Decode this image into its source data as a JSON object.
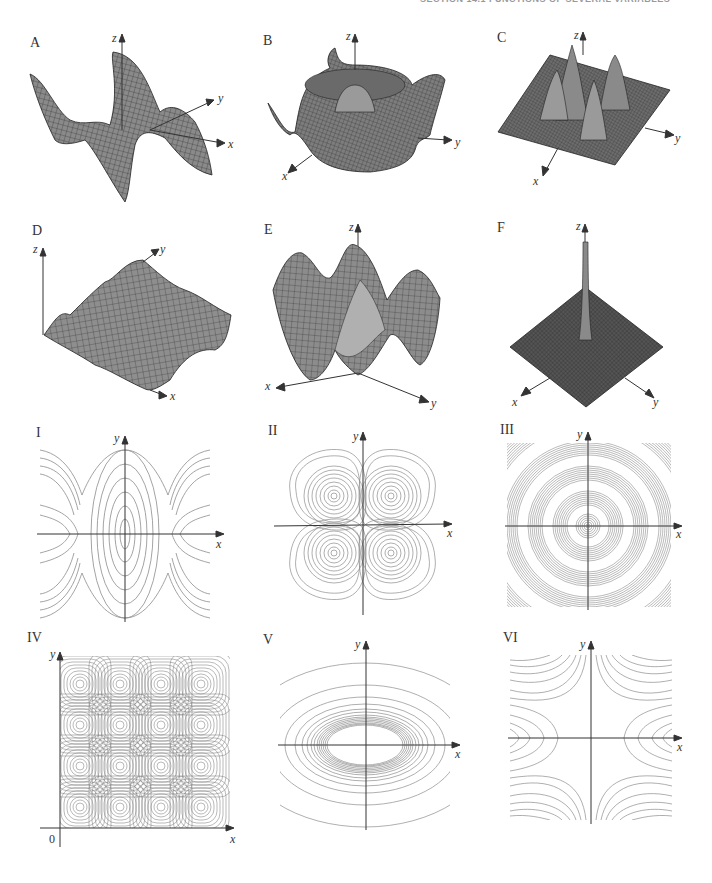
{
  "page": {
    "running_head": "SECTION 14.1  FUNCTIONS OF SEVERAL VARIABLES"
  },
  "surfaces": [
    {
      "label": "A",
      "axes": {
        "z": "z",
        "y": "y",
        "x": "x"
      },
      "description": "saddle-like twisted surface with oscillating edges"
    },
    {
      "label": "B",
      "axes": {
        "z": "z",
        "y": "y",
        "x": "x"
      },
      "description": "radially symmetric ring with central bump and raised corners"
    },
    {
      "label": "C",
      "axes": {
        "z": "z",
        "y": "y",
        "x": "x"
      },
      "description": "four gaussian peaks on a flat square"
    },
    {
      "label": "D",
      "axes": {
        "z": "z",
        "y": "y",
        "x": "x"
      },
      "description": "periodic egg-crate surface in first quadrant"
    },
    {
      "label": "E",
      "axes": {
        "z": "z",
        "y": "y",
        "x": "x"
      },
      "description": "wavy trough surface, oscillating in one direction"
    },
    {
      "label": "F",
      "axes": {
        "z": "z",
        "y": "y",
        "x": "x"
      },
      "description": "single sharp spike at origin on flat plane"
    }
  ],
  "contours": [
    {
      "label": "I",
      "axes": {
        "x": "x",
        "y": "y"
      },
      "description": "closed ellipses at origin and edges, saddle curves between"
    },
    {
      "label": "II",
      "axes": {
        "x": "x",
        "y": "y"
      },
      "description": "four-lobed closed curves, one per quadrant"
    },
    {
      "label": "III",
      "axes": {
        "x": "x",
        "y": "y"
      },
      "description": "concentric circles with bands"
    },
    {
      "label": "IV",
      "axes": {
        "x": "x",
        "y": "y",
        "origin": "0"
      },
      "description": "4x4 grid of closed rounded-square level curves"
    },
    {
      "label": "V",
      "axes": {
        "x": "x",
        "y": "y"
      },
      "description": "nested horizontal ellipses, dense near center"
    },
    {
      "label": "VI",
      "axes": {
        "x": "x",
        "y": "y"
      },
      "description": "hyperbola-like level curves"
    }
  ],
  "colors": {
    "surface_fill": "#8a8a8a",
    "surface_mesh": "#2a2a2a",
    "contour_line": "#8c8c8c",
    "axis": "#333333"
  }
}
